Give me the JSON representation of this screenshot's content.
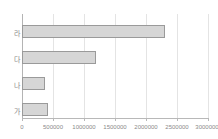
{
  "chart": {
    "title": "",
    "title_faint_remnant": ""
  },
  "chart_data": {
    "type": "bar",
    "orientation": "horizontal",
    "title": "",
    "xlabel": "",
    "ylabel": "",
    "categories": [
      "가",
      "나",
      "다",
      "라"
    ],
    "values": [
      420000,
      370000,
      1190000,
      2300000
    ],
    "series": [
      {
        "name": "",
        "values": [
          420000,
          370000,
          1190000,
          2300000
        ]
      }
    ],
    "xlim": [
      0,
      3000000
    ],
    "xticks": [
      0,
      500000,
      1000000,
      1500000,
      2000000,
      2500000,
      3000000
    ],
    "xtick_labels": [
      "0",
      "500000",
      "1000000",
      "1500000",
      "2000000",
      "2500000",
      "3000000"
    ],
    "grid": true,
    "grid_axis": "x",
    "legend": false,
    "legend_position": "none",
    "bar_fill_color": "#d6d6d6",
    "bar_border_color": "#9a9a9a",
    "gridline_color": "#e4e4e4",
    "axis_color": "#b8b8b8",
    "tick_label_color": "#8a8a8a"
  }
}
